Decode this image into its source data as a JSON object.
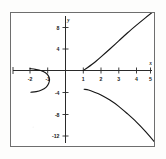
{
  "figure": {
    "kind": "cartesian-graph",
    "background_color": "#ffffff",
    "frame_color": "#6e6e6e",
    "curve_color": "#161616"
  },
  "axes": {
    "x_axis_name": "x",
    "y_axis_name": "y",
    "x_ticks": [
      {
        "label": "-2",
        "value": -2
      },
      {
        "label": "-1",
        "value": -1
      },
      {
        "label": "1",
        "value": 1
      },
      {
        "label": "2",
        "value": 2
      },
      {
        "label": "3",
        "value": 3
      },
      {
        "label": "4",
        "value": 4
      },
      {
        "label": "5",
        "value": 5
      }
    ],
    "y_ticks": [
      {
        "label": "8",
        "value": 8
      },
      {
        "label": "4",
        "value": 4
      },
      {
        "label": "-4",
        "value": -4
      },
      {
        "label": "-8",
        "value": -8
      },
      {
        "label": "-12",
        "value": -12
      }
    ]
  },
  "chart_data": {
    "type": "line",
    "title": "",
    "subtitle": "",
    "xlabel": "x",
    "ylabel": "y",
    "xlim": [
      -2.6,
      5.6
    ],
    "ylim": [
      -14.5,
      11.5
    ],
    "grid": false,
    "legend": null,
    "axis_style": "centered-cross",
    "series": [
      {
        "name": "upper-right-branch",
        "style": "solid",
        "points": [
          {
            "x": 1.0,
            "y": 0.0
          },
          {
            "x": 1.25,
            "y": 0.55
          },
          {
            "x": 1.5,
            "y": 1.15
          },
          {
            "x": 1.75,
            "y": 1.8
          },
          {
            "x": 2.0,
            "y": 2.5
          },
          {
            "x": 2.5,
            "y": 3.95
          },
          {
            "x": 3.0,
            "y": 5.45
          },
          {
            "x": 3.5,
            "y": 6.95
          },
          {
            "x": 4.0,
            "y": 8.35
          },
          {
            "x": 4.5,
            "y": 9.7
          },
          {
            "x": 5.0,
            "y": 11.0
          }
        ]
      },
      {
        "name": "lower-right-branch",
        "style": "solid",
        "points": [
          {
            "x": 1.05,
            "y": -3.45
          },
          {
            "x": 1.3,
            "y": -3.6
          },
          {
            "x": 1.6,
            "y": -3.95
          },
          {
            "x": 2.0,
            "y": -4.5
          },
          {
            "x": 2.5,
            "y": -5.45
          },
          {
            "x": 3.0,
            "y": -6.6
          },
          {
            "x": 3.5,
            "y": -8.0
          },
          {
            "x": 4.0,
            "y": -9.5
          },
          {
            "x": 4.5,
            "y": -11.2
          },
          {
            "x": 5.0,
            "y": -13.1
          },
          {
            "x": 5.3,
            "y": -14.4
          }
        ]
      },
      {
        "name": "left-loop-branch",
        "style": "solid",
        "points": [
          {
            "x": -2.0,
            "y": 0.35
          },
          {
            "x": -1.7,
            "y": 0.2
          },
          {
            "x": -1.4,
            "y": 0.0
          },
          {
            "x": -1.15,
            "y": -0.35
          },
          {
            "x": -0.98,
            "y": -0.9
          },
          {
            "x": -0.9,
            "y": -1.6
          },
          {
            "x": -0.95,
            "y": -2.4
          },
          {
            "x": -1.1,
            "y": -3.1
          },
          {
            "x": -1.35,
            "y": -3.6
          },
          {
            "x": -1.65,
            "y": -3.9
          },
          {
            "x": -1.95,
            "y": -4.0
          }
        ]
      }
    ]
  }
}
